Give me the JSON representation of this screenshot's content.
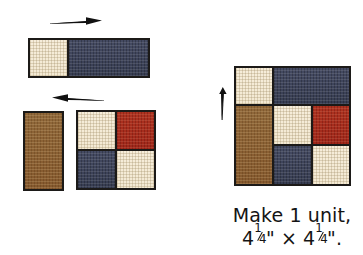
{
  "figure": {
    "kind": "quilt-piecing-diagram",
    "background_color": "#ffffff",
    "outline_color": "#1c1a18"
  },
  "palette": {
    "cream": "#f4ead5",
    "navy": "#3e445c",
    "brown": "#8a5f33",
    "red": "#a82d1e",
    "outline": "#1c1a18",
    "text": "#141414"
  },
  "steps": {
    "top_strip": {
      "name": "cream-navy-strip",
      "patches": [
        {
          "label": "cream-square",
          "fabric": "cream"
        },
        {
          "label": "navy-rectangle",
          "fabric": "navy"
        }
      ],
      "arrow": {
        "label": "press-seam-right-arrow",
        "direction": "right"
      }
    },
    "bottom_row": {
      "brown_bar": {
        "label": "brown-rectangle",
        "fabric": "brown"
      },
      "four_patch": {
        "name": "four-patch-unit",
        "patches": [
          {
            "label": "cream-square-top-left",
            "fabric": "cream"
          },
          {
            "label": "red-square-top-right",
            "fabric": "red"
          },
          {
            "label": "navy-square-bottom-left",
            "fabric": "navy"
          },
          {
            "label": "cream-square-bottom-right",
            "fabric": "cream"
          }
        ]
      },
      "arrow": {
        "label": "press-seam-left-arrow",
        "direction": "left"
      }
    },
    "final_unit": {
      "name": "assembled-unit",
      "patches": [
        {
          "label": "cream-square-top-left",
          "fabric": "cream"
        },
        {
          "label": "navy-rectangle-top-right",
          "fabric": "navy"
        },
        {
          "label": "brown-rectangle-left",
          "fabric": "brown"
        },
        {
          "label": "cream-square-center",
          "fabric": "cream"
        },
        {
          "label": "red-square-right",
          "fabric": "red"
        },
        {
          "label": "navy-square-bottom-center",
          "fabric": "navy"
        },
        {
          "label": "cream-square-bottom-right",
          "fabric": "cream"
        }
      ],
      "arrow": {
        "label": "press-seam-up-arrow",
        "direction": "up"
      }
    }
  },
  "caption": {
    "line1": "Make 1 unit,",
    "measure_whole": "4",
    "fraction_numerator": "1",
    "fraction_denominator": "4",
    "inch_mark": "\"",
    "times_symbol": "×",
    "trailing_period": "."
  }
}
